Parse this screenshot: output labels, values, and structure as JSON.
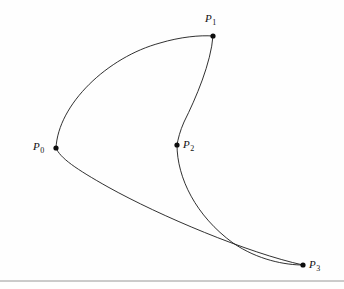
{
  "figure": {
    "kind": "bezier-curve-diagram",
    "background_color": "#fefefe",
    "curve_color": "#1a1a1a",
    "dot_color": "#0d0d0d",
    "rule_color": "#8d8d8d",
    "width": 344,
    "height": 289
  },
  "chart_data": {
    "type": "line",
    "title": "",
    "xlabel": "",
    "ylabel": "",
    "xlim": [
      0,
      344
    ],
    "ylim": [
      289,
      0
    ],
    "grid": false,
    "legend": null,
    "control_points": [
      {
        "name": "P0",
        "label_text": "P",
        "subscript": "0",
        "x": 56,
        "y": 148,
        "label_x": 33,
        "label_y": 141,
        "label_side": "left"
      },
      {
        "name": "P1",
        "label_text": "P",
        "subscript": "1",
        "x": 213,
        "y": 36,
        "label_x": 205,
        "label_y": 13,
        "label_side": "above"
      },
      {
        "name": "P2",
        "label_text": "P",
        "subscript": "2",
        "x": 177,
        "y": 145,
        "label_x": 183,
        "label_y": 139,
        "label_side": "right"
      },
      {
        "name": "P3",
        "label_text": "P",
        "subscript": "3",
        "x": 303,
        "y": 265,
        "label_x": 309,
        "label_y": 259,
        "label_side": "right"
      }
    ],
    "curve_segments": [
      {
        "name": "upper-arc-p0-to-p1",
        "from": "P0",
        "to": "P1",
        "path": "M 56 148 C 58 104 108 57 160 43 C 180 37 200 35 213 36"
      },
      {
        "name": "descent-p1-to-p2",
        "from": "P1",
        "to": "P2",
        "path": "M 213 36 C 211 63 196 98 184 122 C 180 131 178 139 177 145"
      },
      {
        "name": "descent-p2-to-p3",
        "from": "P2",
        "to": "P3",
        "path": "M 177 145 C 177 178 196 216 233 243 C 258 260 285 265 303 265"
      },
      {
        "name": "lower-return-p3-to-p0",
        "from": "P3",
        "to": "P0",
        "path": "M 303 265 C 248 253 160 216 108 187 C 76 169 60 158 56 148"
      }
    ],
    "baseline_rule": {
      "name": "baseline-rule",
      "x1": 0,
      "y1": 281,
      "x2": 344,
      "y2": 281
    }
  }
}
